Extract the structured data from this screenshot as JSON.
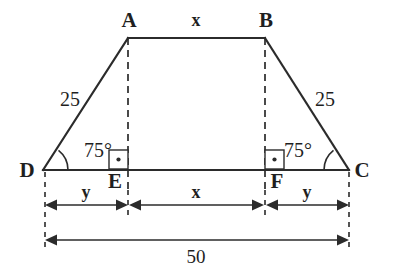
{
  "figure": {
    "shape_type": "trapezoid"
  },
  "vertices": {
    "a": "A",
    "b": "B",
    "c": "C",
    "d": "D",
    "e": "E",
    "f": "F"
  },
  "sides": {
    "top_label": "x",
    "left_leg": "25",
    "right_leg": "25"
  },
  "angles": {
    "at_d": "75°",
    "at_c": "75°",
    "right_angle_at_e": "90°",
    "right_angle_at_f": "90°"
  },
  "dimensions": {
    "segment_de": "y",
    "segment_ef": "x",
    "segment_fc": "y",
    "segment_dc": "50"
  },
  "colors": {
    "stroke": "#2b2b2b",
    "text": "#1f1f1f",
    "background": "#ffffff"
  }
}
